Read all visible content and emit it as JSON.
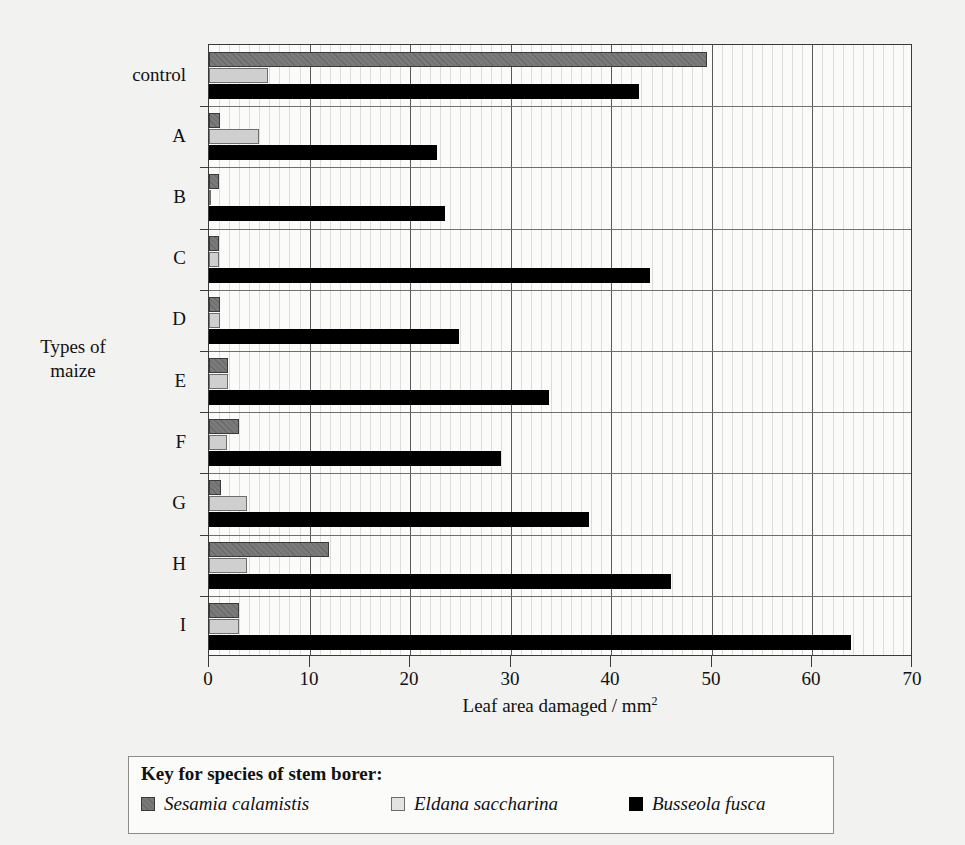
{
  "chart_data": {
    "type": "bar",
    "orientation": "horizontal",
    "title": "",
    "xlabel": "Leaf area damaged / mm2",
    "xlabel_base": "Leaf area damaged / mm",
    "xlabel_sup": "2",
    "ylabel": "Types of maize",
    "ylabel_line1": "Types of",
    "ylabel_line2": "maize",
    "categories": [
      "control",
      "A",
      "B",
      "C",
      "D",
      "E",
      "F",
      "G",
      "H",
      "I"
    ],
    "xlim": [
      0,
      70
    ],
    "xticks": [
      0,
      10,
      20,
      30,
      40,
      50,
      60,
      70
    ],
    "xtick_labels": [
      "0",
      "10",
      "20",
      "30",
      "40",
      "50",
      "60",
      "70"
    ],
    "grid": "vertical minor gridlines every 1 unit, major every 10 units",
    "legend_position": "below plot, boxed",
    "series": [
      {
        "name": "Sesamia calamistis",
        "color": "#7a7a7a",
        "values": [
          49.5,
          1.1,
          1.0,
          1.0,
          1.1,
          1.9,
          3.0,
          1.2,
          11.9,
          3.0
        ]
      },
      {
        "name": "Eldana saccharina",
        "color": "#cfcfcf",
        "values": [
          5.9,
          5.0,
          0.2,
          1.0,
          1.1,
          1.9,
          1.8,
          3.8,
          3.8,
          3.0
        ]
      },
      {
        "name": "Busseola fusca",
        "color": "#000000",
        "values": [
          42.8,
          22.7,
          23.5,
          43.8,
          24.9,
          33.8,
          29.0,
          37.8,
          45.9,
          63.8
        ]
      }
    ]
  },
  "legend": {
    "title": "Key for species of stem borer:",
    "entries": [
      {
        "label": "Sesamia calamistis",
        "swatch": "sesamia"
      },
      {
        "label": "Eldana saccharina",
        "swatch": "eldana"
      },
      {
        "label": "Busseola fusca",
        "swatch": "busseola"
      }
    ]
  }
}
